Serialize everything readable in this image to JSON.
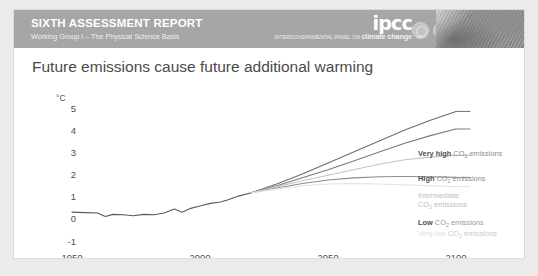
{
  "header": {
    "report_title": "SIXTH ASSESSMENT REPORT",
    "report_subtitle": "Working Group I – The Physical Science Basis",
    "logo_word": "ipcc",
    "logo_tagline_prefix": "INTERGOVERNMENTAL PANEL ON ",
    "logo_tagline_bold": "climate change",
    "emblems": [
      {
        "name": "wmo-emblem",
        "caption": "WMO"
      },
      {
        "name": "unep-emblem",
        "caption": "UNEP"
      }
    ],
    "photo_name": "landscape-photo-strip",
    "band_color": "#a6a6a6"
  },
  "chart_data": {
    "type": "line",
    "title": "Future emissions cause future additional warming",
    "xlabel": "",
    "ylabel": "",
    "unit_label": "°C",
    "xlim": [
      1950,
      2110
    ],
    "ylim": [
      -1,
      5.4
    ],
    "xticks": [
      1950,
      2000,
      2050,
      2100
    ],
    "yticks": [
      5,
      4,
      3,
      2,
      1,
      0,
      -1
    ],
    "grid": false,
    "legend_position": "right-inline",
    "series": [
      {
        "name": "Historical",
        "label": "",
        "color": "#5a5a5a",
        "x": [
          1950,
          1955,
          1960,
          1963,
          1966,
          1970,
          1974,
          1978,
          1982,
          1986,
          1990,
          1993,
          1996,
          2000,
          2004,
          2008,
          2011,
          2015,
          2020
        ],
        "values": [
          0.22,
          0.2,
          0.18,
          0.02,
          0.12,
          0.1,
          0.06,
          0.12,
          0.1,
          0.18,
          0.36,
          0.22,
          0.38,
          0.5,
          0.62,
          0.68,
          0.78,
          0.95,
          1.1
        ]
      },
      {
        "name": "Very high CO2 emissions",
        "label": "Very high",
        "color": "#6e6e6e",
        "x": [
          2020,
          2030,
          2040,
          2050,
          2060,
          2070,
          2080,
          2090,
          2100
        ],
        "values": [
          1.1,
          1.5,
          1.95,
          2.45,
          2.95,
          3.45,
          3.95,
          4.4,
          4.8
        ]
      },
      {
        "name": "High CO2 emissions",
        "label": "High",
        "color": "#7a7a7a",
        "x": [
          2020,
          2030,
          2040,
          2050,
          2060,
          2070,
          2080,
          2090,
          2100
        ],
        "values": [
          1.1,
          1.42,
          1.78,
          2.15,
          2.55,
          2.95,
          3.35,
          3.7,
          4.0
        ]
      },
      {
        "name": "Intermediate CO2 emissions",
        "label": "Intermediate",
        "color": "#c4c4c4",
        "x": [
          2020,
          2030,
          2040,
          2050,
          2060,
          2070,
          2080,
          2090,
          2100
        ],
        "values": [
          1.1,
          1.38,
          1.65,
          1.9,
          2.15,
          2.4,
          2.6,
          2.72,
          2.8
        ]
      },
      {
        "name": "Low CO2 emissions",
        "label": "Low",
        "color": "#8c8c8c",
        "x": [
          2020,
          2030,
          2040,
          2050,
          2060,
          2070,
          2080,
          2090,
          2100
        ],
        "values": [
          1.1,
          1.32,
          1.52,
          1.68,
          1.78,
          1.83,
          1.84,
          1.83,
          1.8
        ]
      },
      {
        "name": "Very low CO2 emissions",
        "label": "Very low",
        "color": "#e2e2e2",
        "x": [
          2020,
          2030,
          2040,
          2050,
          2060,
          2070,
          2080,
          2090,
          2100
        ],
        "values": [
          1.1,
          1.28,
          1.42,
          1.5,
          1.52,
          1.5,
          1.46,
          1.42,
          1.38
        ]
      }
    ],
    "annotations": [
      {
        "text_bold": "Very high",
        "text_rest": "CO₂ emissions"
      },
      {
        "text_bold": "High",
        "text_rest": "CO₂ emissions"
      },
      {
        "text_bold": "Intermediate",
        "text_rest": "CO₂ emissions"
      },
      {
        "text_bold": "Low",
        "text_rest": "CO₂ emissions"
      },
      {
        "text_bold": "Very low",
        "text_rest": "CO₂ emissions"
      }
    ]
  },
  "axis": {
    "unit": "°C",
    "y": {
      "t5": "5",
      "t4": "4",
      "t3": "3",
      "t2": "2",
      "t1": "1",
      "t0": "0",
      "tm1": "-1"
    },
    "x": {
      "t1950": "1950",
      "t2000": "2000",
      "t2050": "2050",
      "t2100": "2100"
    }
  },
  "labels": {
    "vhigh_bold": "Very high",
    "vhigh_rest": "CO",
    "vhigh_rest2": " emissions",
    "high_bold": "High",
    "inter_bold": "Intermediate",
    "inter_line2_rest": "CO",
    "low_bold": "Low",
    "vlow_bold": "Very low",
    "sub2": "2",
    "emissions": " emissions"
  }
}
